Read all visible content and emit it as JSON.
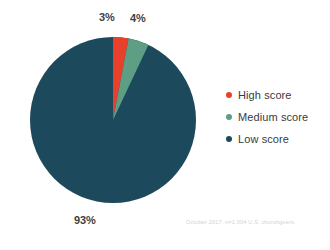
{
  "chart_data": {
    "type": "pie",
    "title": "",
    "subtitle": "",
    "xlabel": "",
    "ylabel": "",
    "legend_position": "right",
    "grid": false,
    "start_angle_deg": 0,
    "direction": "clockwise",
    "categories": [
      "High score",
      "Medium score",
      "Low score"
    ],
    "values": [
      3,
      4,
      93
    ],
    "value_unit": "%",
    "slices": [
      {
        "label": "High score",
        "value": 3,
        "display": "3%",
        "color": "#e8402a"
      },
      {
        "label": "Medium score",
        "value": 4,
        "display": "4%",
        "color": "#5e9e84"
      },
      {
        "label": "Low score",
        "value": 93,
        "display": "93%",
        "color": "#1c4a5c"
      }
    ],
    "annotations": [
      "October 2017. n=1,004 U.S. churchgoers."
    ]
  },
  "labels": {
    "high": "3%",
    "medium": "4%",
    "low": "93%"
  },
  "legend": {
    "items": [
      {
        "label": "High score",
        "color": "#e8402a"
      },
      {
        "label": "Medium score",
        "color": "#5e9e84"
      },
      {
        "label": "Low score",
        "color": "#1c4a5c"
      }
    ]
  },
  "footnote": {
    "text": "October 2017. n=1,004 U.S. churchgoers."
  },
  "colors": {
    "background": "#ffffff",
    "high_score": "#e8402a",
    "medium_score": "#5e9e84",
    "low_score": "#1c4a5c",
    "label_text": "#3f3f3f",
    "legend_text": "#3a3a3a",
    "footnote_text": "#d2d2d2"
  }
}
